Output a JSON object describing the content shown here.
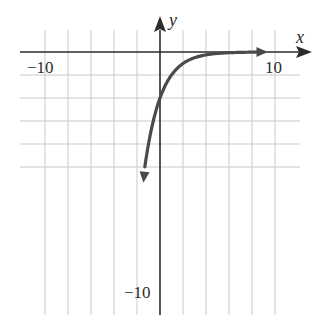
{
  "chart_data": {
    "type": "line",
    "title": "",
    "xlabel": "x",
    "ylabel": "y",
    "xlim": [
      -10,
      10
    ],
    "ylim": [
      -10,
      0
    ],
    "grid": true,
    "grid_step": 2,
    "legend": null,
    "tick_labels": {
      "x_min": "−10",
      "x_max": "10",
      "y_min": "−10"
    },
    "series": [
      {
        "name": "curve",
        "description": "decreasing-magnitude exponential, y approaches 0 as x increases; y-intercept -4",
        "x": [
          -1.32,
          -1,
          -0.5,
          0,
          0.5,
          1,
          1.5,
          2,
          3,
          4,
          5,
          6,
          7,
          8,
          9
        ],
        "y": [
          -10,
          -8,
          -5.66,
          -4,
          -2.83,
          -2,
          -1.41,
          -1,
          -0.5,
          -0.25,
          -0.125,
          -0.06,
          -0.03,
          -0.02,
          -0.01
        ],
        "arrow_ends": true
      }
    ],
    "colors": {
      "grid": "#c9c9c9",
      "axes": "#2b2b2b",
      "curve": "#4a4a4a"
    }
  }
}
